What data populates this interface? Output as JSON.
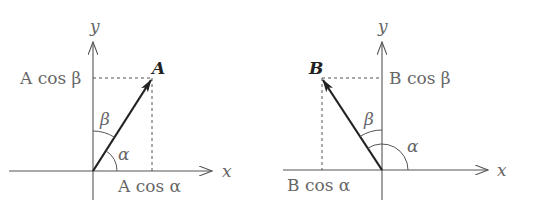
{
  "diagram": {
    "left": {
      "axis_x_label": "x",
      "axis_y_label": "y",
      "vector_label": "A",
      "angle_alpha": "α",
      "angle_beta": "β",
      "proj_y_label": "A cos β",
      "proj_x_label": "A cos α"
    },
    "right": {
      "axis_x_label": "x",
      "axis_y_label": "y",
      "vector_label": "B",
      "angle_alpha": "α",
      "angle_beta": "β",
      "proj_y_label": "B cos β",
      "proj_x_label": "B cos α"
    }
  }
}
